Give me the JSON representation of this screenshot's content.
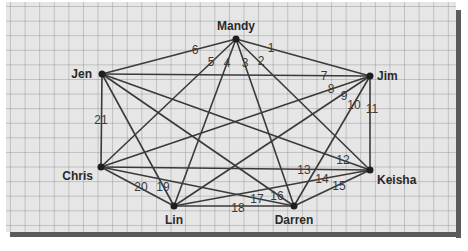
{
  "diagram": {
    "type": "complete-graph",
    "colors": {
      "paper": "#e6e6e6",
      "grid": "#a0a0a0",
      "edge": "#3a3a3a",
      "node": "#1e1e1e",
      "frame_shadow": "#5a5a5a"
    },
    "nodes": [
      {
        "id": "mandy",
        "label": "Mandy",
        "x": 236,
        "y": 39,
        "lx": 236,
        "ly": 30,
        "anchor": "middle"
      },
      {
        "id": "jen",
        "label": "Jen",
        "x": 102,
        "y": 74,
        "lx": 92,
        "ly": 78,
        "anchor": "end"
      },
      {
        "id": "jim",
        "label": "Jim",
        "x": 370,
        "y": 76,
        "lx": 377,
        "ly": 80,
        "anchor": "start"
      },
      {
        "id": "chris",
        "label": "Chris",
        "x": 101,
        "y": 167,
        "lx": 93,
        "ly": 180,
        "anchor": "end"
      },
      {
        "id": "keisha",
        "label": "Keisha",
        "x": 370,
        "y": 170,
        "lx": 377,
        "ly": 184,
        "anchor": "start"
      },
      {
        "id": "lin",
        "label": "Lin",
        "x": 174,
        "y": 206,
        "lx": 174,
        "ly": 224,
        "anchor": "middle"
      },
      {
        "id": "darren",
        "label": "Darren",
        "x": 294,
        "y": 206,
        "lx": 294,
        "ly": 224,
        "anchor": "middle"
      }
    ],
    "edges": [
      {
        "label": "1",
        "from": "mandy",
        "to": "jim",
        "lx": 271,
        "ly": 52
      },
      {
        "label": "2",
        "from": "mandy",
        "to": "keisha",
        "lx": 261,
        "ly": 65
      },
      {
        "label": "3",
        "from": "mandy",
        "to": "darren",
        "lx": 245,
        "ly": 67
      },
      {
        "label": "4",
        "from": "mandy",
        "to": "lin",
        "lx": 227,
        "ly": 67
      },
      {
        "label": "5",
        "from": "mandy",
        "to": "chris",
        "lx": 211,
        "ly": 66
      },
      {
        "label": "6",
        "from": "mandy",
        "to": "jen",
        "lx": 195,
        "ly": 54
      },
      {
        "label": "7",
        "from": "jen",
        "to": "jim",
        "lx": 324,
        "ly": 80
      },
      {
        "label": "8",
        "from": "jim",
        "to": "chris",
        "lx": 331,
        "ly": 93
      },
      {
        "label": "9",
        "from": "jim",
        "to": "lin",
        "lx": 344,
        "ly": 100
      },
      {
        "label": "10",
        "from": "jim",
        "to": "darren",
        "lx": 354,
        "ly": 109
      },
      {
        "label": "11",
        "from": "jim",
        "to": "keisha",
        "lx": 372,
        "ly": 113
      },
      {
        "label": "12",
        "from": "jen",
        "to": "keisha",
        "lx": 343,
        "ly": 164
      },
      {
        "label": "13",
        "from": "chris",
        "to": "keisha",
        "lx": 304,
        "ly": 174
      },
      {
        "label": "14",
        "from": "lin",
        "to": "keisha",
        "lx": 322,
        "ly": 183
      },
      {
        "label": "15",
        "from": "darren",
        "to": "keisha",
        "lx": 339,
        "ly": 190
      },
      {
        "label": "16",
        "from": "jen",
        "to": "darren",
        "lx": 277,
        "ly": 200
      },
      {
        "label": "17",
        "from": "chris",
        "to": "darren",
        "lx": 257,
        "ly": 203
      },
      {
        "label": "18",
        "from": "lin",
        "to": "darren",
        "lx": 238,
        "ly": 212
      },
      {
        "label": "19",
        "from": "jen",
        "to": "lin",
        "lx": 163,
        "ly": 191
      },
      {
        "label": "20",
        "from": "chris",
        "to": "lin",
        "lx": 141,
        "ly": 191
      },
      {
        "label": "21",
        "from": "jen",
        "to": "chris",
        "lx": 101,
        "ly": 124
      }
    ]
  }
}
